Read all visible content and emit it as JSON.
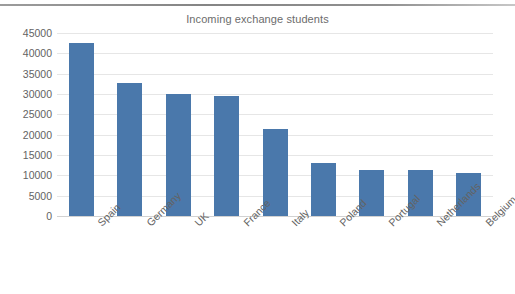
{
  "chart_data": {
    "type": "bar",
    "title": "Incoming exchange students",
    "xlabel": "",
    "ylabel": "",
    "categories": [
      "Spain",
      "Germany",
      "UK",
      "France",
      "Italy",
      "Poland",
      "Portugal",
      "Netherlands",
      "Belgium"
    ],
    "values": [
      42500,
      32800,
      30100,
      29500,
      21500,
      13000,
      11400,
      11400,
      10500
    ],
    "ylim": [
      0,
      45000
    ],
    "yticks": [
      0,
      5000,
      10000,
      15000,
      20000,
      25000,
      30000,
      35000,
      40000,
      45000
    ],
    "ytick_labels": [
      "0",
      "5000",
      "10000",
      "15000",
      "20000",
      "25000",
      "30000",
      "35000",
      "40000",
      "45000"
    ],
    "grid": "horizontal",
    "legend": "none",
    "series": [
      {
        "name": "Incoming exchange students",
        "color": "#4a78ab",
        "values": [
          42500,
          32800,
          30100,
          29500,
          21500,
          13000,
          11400,
          11400,
          10500
        ]
      }
    ]
  },
  "style": {
    "bar_color": "#4a78ab",
    "gridline_color": "#e6e6e6",
    "axis_color": "#d2d2d2",
    "tick_text_color": "#636363",
    "title_color": "#6c6c6c",
    "background": "#ffffff"
  }
}
